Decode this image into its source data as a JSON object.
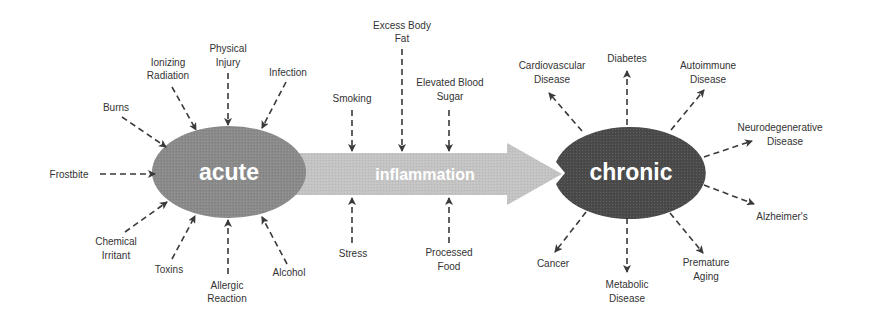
{
  "diagram": {
    "colors": {
      "acute": "#8a8a8a",
      "inflammation_arrow": "#c4c4c4",
      "chronic": "#4a4a4a",
      "arrows": "#3a3a3a",
      "label_text": "#333333",
      "shape_text": "#ffffff"
    },
    "nodes": {
      "acute": "acute",
      "inflammation": "inflammation",
      "chronic": "chronic"
    },
    "acute_causes": [
      {
        "line1": "Frostbite",
        "line2": ""
      },
      {
        "line1": "Burns",
        "line2": ""
      },
      {
        "line1": "Ionizing",
        "line2": "Radiation"
      },
      {
        "line1": "Physical",
        "line2": "Injury"
      },
      {
        "line1": "Infection",
        "line2": ""
      },
      {
        "line1": "Chemical",
        "line2": "Irritant"
      },
      {
        "line1": "Toxins",
        "line2": ""
      },
      {
        "line1": "Allergic",
        "line2": "Reaction"
      },
      {
        "line1": "Alcohol",
        "line2": ""
      }
    ],
    "inflammation_factors_top": [
      {
        "line1": "Smoking",
        "line2": ""
      },
      {
        "line1": "Excess Body",
        "line2": "Fat"
      },
      {
        "line1": "Elevated Blood",
        "line2": "Sugar"
      }
    ],
    "inflammation_factors_bottom": [
      {
        "line1": "Stress",
        "line2": ""
      },
      {
        "line1": "Processed",
        "line2": "Food"
      }
    ],
    "chronic_outcomes": [
      {
        "line1": "Cardiovascular",
        "line2": "Disease"
      },
      {
        "line1": "Diabetes",
        "line2": ""
      },
      {
        "line1": "Autoimmune",
        "line2": "Disease"
      },
      {
        "line1": "Neurodegenerative",
        "line2": "Disease"
      },
      {
        "line1": "Alzheimer's",
        "line2": ""
      },
      {
        "line1": "Premature",
        "line2": "Aging"
      },
      {
        "line1": "Metabolic",
        "line2": "Disease"
      },
      {
        "line1": "Cancer",
        "line2": ""
      }
    ]
  }
}
